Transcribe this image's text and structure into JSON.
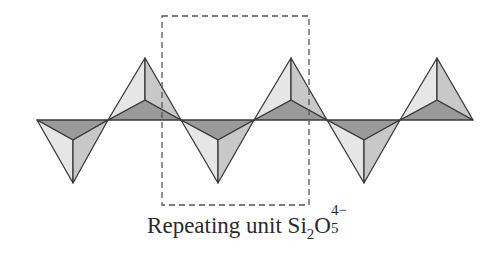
{
  "figure": {
    "type": "silicate chain structure diagram",
    "caption": {
      "prefix": "Repeating unit ",
      "formula": {
        "element1": "Si",
        "element1_subscript": "2",
        "element2": "O",
        "element2_subscript": "5",
        "charge": "4−"
      }
    },
    "repeat_box": {
      "style": "dashed",
      "x": 162,
      "y": 16,
      "width": 147,
      "height": 189
    },
    "tetrahedra": [
      {
        "orientation": "down",
        "left": 37,
        "right": 108,
        "apex_x": 73
      },
      {
        "orientation": "up",
        "left": 108,
        "right": 181,
        "apex_x": 145
      },
      {
        "orientation": "down",
        "left": 181,
        "right": 254,
        "apex_x": 218
      },
      {
        "orientation": "up",
        "left": 254,
        "right": 327,
        "apex_x": 291
      },
      {
        "orientation": "down",
        "left": 327,
        "right": 400,
        "apex_x": 364
      },
      {
        "orientation": "up",
        "left": 400,
        "right": 473,
        "apex_x": 437
      }
    ],
    "colors": {
      "stroke": "#3a3a3a",
      "dark_face": "#9a9a9a",
      "light_face": "#e6e6e6",
      "mid_face": "#c8c8c8",
      "dash": "#555555"
    }
  }
}
